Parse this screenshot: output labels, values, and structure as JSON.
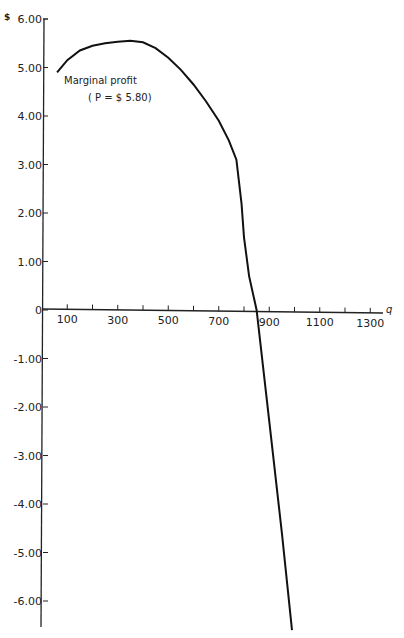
{
  "chart_data": {
    "type": "line",
    "title": "",
    "xlabel": "q",
    "ylabel": "$",
    "xlim": [
      0,
      1350
    ],
    "ylim": [
      -6.5,
      6.0
    ],
    "grid": false,
    "x_ticks": [
      100,
      200,
      300,
      400,
      500,
      600,
      700,
      800,
      900,
      1000,
      1100,
      1200,
      1300
    ],
    "x_tick_labels": [
      "100",
      "300",
      "500",
      "700",
      "900",
      "1100",
      "1300"
    ],
    "y_tick_labels": [
      "6.00",
      "5.00",
      "4.00",
      "3.00",
      "2.00",
      "1.00",
      "0",
      "-1.00",
      "-2.00",
      "-3.00",
      "-4.00",
      "-5.00",
      "-6.00"
    ],
    "series": [
      {
        "name": "Marginal profit (P = $5.80)",
        "x": [
          60,
          100,
          150,
          200,
          250,
          300,
          350,
          400,
          450,
          500,
          550,
          600,
          650,
          700,
          740,
          770,
          790,
          800,
          820,
          850,
          900,
          950,
          990
        ],
        "y": [
          4.9,
          5.15,
          5.35,
          5.45,
          5.5,
          5.53,
          5.55,
          5.52,
          5.4,
          5.2,
          4.95,
          4.65,
          4.3,
          3.9,
          3.5,
          3.1,
          2.2,
          1.5,
          0.7,
          0.0,
          -2.3,
          -4.6,
          -6.6
        ]
      }
    ],
    "annotations": [
      {
        "text": "Marginal profit",
        "x": 80,
        "y": 4.7
      },
      {
        "text": "(P = $ 5.80)",
        "x": 140,
        "y": 4.35
      }
    ]
  },
  "labels": {
    "y_unit": "$",
    "x_axis": "q",
    "annot_line1": "Marginal profit",
    "annot_line2": "( P = $ 5.80)"
  }
}
